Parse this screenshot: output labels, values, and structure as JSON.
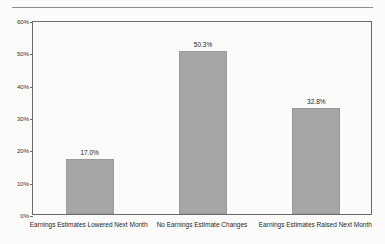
{
  "chart_data": {
    "type": "bar",
    "title": "",
    "subtitle": "",
    "xlabel": "",
    "ylabel": "",
    "ylim": [
      0,
      60
    ],
    "grid": false,
    "legend": false,
    "legend_position": "none",
    "bar_color": "#a6a6a6",
    "frame_color": "#6b6b6b",
    "background_color": "#fbfbfa",
    "categories": [
      "Earnings Estimates Lowered Next Month",
      "No Earnings Estimate Changes",
      "Earnings Estimates Raised Next Month"
    ],
    "values": [
      17.0,
      50.3,
      32.8
    ],
    "value_labels": [
      "17.0%",
      "50.3%",
      "32.8%"
    ],
    "yticks": [
      0,
      10,
      20,
      30,
      40,
      50,
      60
    ],
    "ytick_labels": [
      "0%",
      "10%",
      "20%",
      "30%",
      "40%",
      "50%",
      "60%"
    ]
  }
}
